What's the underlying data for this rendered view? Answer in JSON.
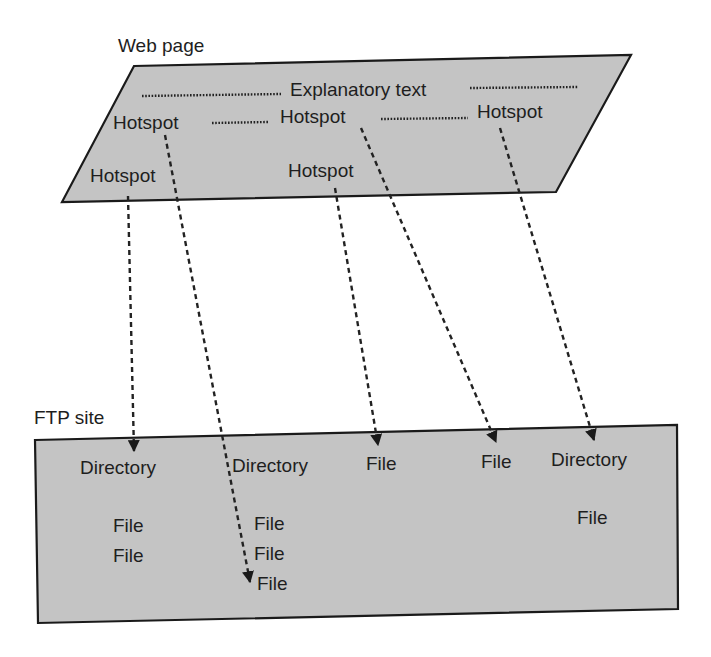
{
  "colors": {
    "shape_fill": "#c4c4c4",
    "stroke": "#1a1a1a",
    "background": "#ffffff"
  },
  "web_page": {
    "title": "Web page",
    "explanatory_text": "Explanatory text",
    "hotspots": [
      {
        "id": "hotspot-top-left",
        "label": "Hotspot"
      },
      {
        "id": "hotspot-top-middle",
        "label": "Hotspot"
      },
      {
        "id": "hotspot-top-right",
        "label": "Hotspot"
      },
      {
        "id": "hotspot-bottom-left",
        "label": "Hotspot"
      },
      {
        "id": "hotspot-bottom-middle",
        "label": "Hotspot"
      }
    ]
  },
  "ftp_site": {
    "title": "FTP site",
    "items": [
      {
        "id": "directory-1",
        "label": "Directory",
        "files": [
          "File",
          "File"
        ]
      },
      {
        "id": "directory-2",
        "label": "Directory",
        "files": [
          "File",
          "File",
          "File"
        ]
      },
      {
        "id": "file-a",
        "label": "File"
      },
      {
        "id": "file-b",
        "label": "File"
      },
      {
        "id": "directory-3",
        "label": "Directory",
        "files": [
          "File"
        ]
      }
    ]
  },
  "links": [
    {
      "from": "hotspot-bottom-left",
      "to": "directory-1"
    },
    {
      "from": "hotspot-top-left",
      "to": "directory-2 / file 3"
    },
    {
      "from": "hotspot-bottom-middle",
      "to": "file-a"
    },
    {
      "from": "hotspot-top-middle",
      "to": "file-b"
    },
    {
      "from": "hotspot-top-right",
      "to": "directory-3"
    }
  ]
}
